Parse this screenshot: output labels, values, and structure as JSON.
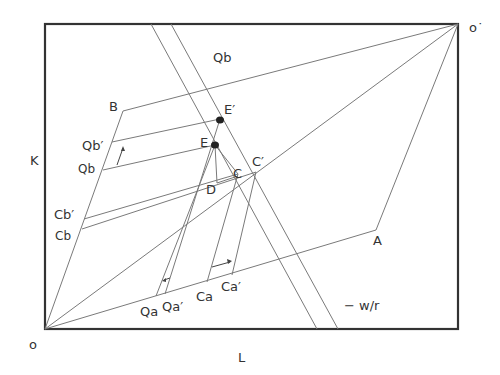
{
  "diagram": {
    "type": "edgeworth-box",
    "axes": {
      "x_label": "L",
      "y_label": "K",
      "origin_label": "o",
      "origin_prime_label": "o˙"
    },
    "points": {
      "A": "A",
      "B": "B",
      "C": "C",
      "C_prime": "C′",
      "D": "D",
      "E": "E",
      "E_prime": "E′"
    },
    "isoquants": {
      "Qb_top": "Qb",
      "Qb_prime": "Qb′",
      "Qb_left": "Qb",
      "Cb_prime": "Cb′",
      "Cb": "Cb",
      "Qa": "Qa",
      "Qa_prime": "Qa′",
      "Ca": "Ca",
      "Ca_prime": "Ca′"
    },
    "price_ratio_label": "− w/r",
    "colors": {
      "frame": "#333333",
      "lines": "#7a7a7a",
      "text": "#333333",
      "dots": "#222222"
    }
  }
}
